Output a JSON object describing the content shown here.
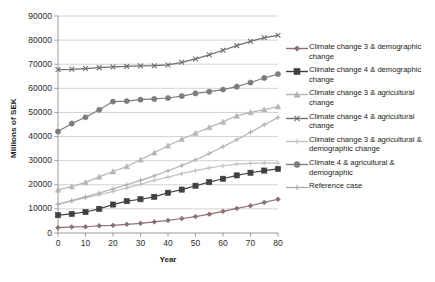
{
  "chart_data": {
    "type": "line",
    "title": "",
    "xlabel": "Year",
    "ylabel": "Millions of SEK",
    "xlim": [
      0,
      80
    ],
    "ylim": [
      0,
      90000
    ],
    "x": [
      0,
      5,
      10,
      15,
      20,
      25,
      30,
      35,
      40,
      45,
      50,
      55,
      60,
      65,
      70,
      75,
      80
    ],
    "xticks": [
      "0",
      "10",
      "20",
      "30",
      "40",
      "50",
      "60",
      "70",
      "80"
    ],
    "yticks": [
      "0",
      "10000",
      "20000",
      "30000",
      "40000",
      "50000",
      "60000",
      "70000",
      "80000",
      "90000"
    ],
    "grid": "horizontal",
    "legend_position": "right",
    "series": [
      {
        "name": "Climate change 3 & demographic change",
        "color": "#8c7070",
        "marker": "diamond",
        "values": [
          2200,
          2500,
          2600,
          3000,
          3200,
          3600,
          4000,
          4600,
          5200,
          6000,
          6800,
          7800,
          9000,
          10200,
          11300,
          12700,
          14000
        ]
      },
      {
        "name": "Climate change 4 & demographic change",
        "color": "#404040",
        "marker": "square",
        "values": [
          7400,
          7900,
          8700,
          10000,
          11800,
          13200,
          14000,
          15000,
          16700,
          18000,
          19600,
          21100,
          22500,
          23900,
          25000,
          25900,
          26600
        ]
      },
      {
        "name": "Climate change 3 & agricultural change",
        "color": "#b5b5b5",
        "marker": "triangle",
        "values": [
          17900,
          19300,
          21000,
          23300,
          25500,
          27600,
          30400,
          33300,
          36200,
          38900,
          41400,
          43800,
          46100,
          48600,
          50000,
          51200,
          52400
        ]
      },
      {
        "name": "Climate change 4 & agricultural change",
        "color": "#6e6e6e",
        "marker": "cross",
        "values": [
          67800,
          67900,
          68200,
          68600,
          68900,
          69100,
          69300,
          69400,
          69700,
          70800,
          72200,
          73900,
          75800,
          77700,
          79500,
          81000,
          82000
        ]
      },
      {
        "name": "Climate change 3 & agricultural & demographic change",
        "color": "#c2c2c2",
        "marker": "plus",
        "values": [
          12000,
          13300,
          14600,
          15900,
          17200,
          18700,
          20200,
          21800,
          23200,
          24600,
          25900,
          27000,
          27900,
          28600,
          28900,
          29000,
          29000
        ]
      },
      {
        "name": "Climate 4 & agricultural & demographic",
        "color": "#7d7d7d",
        "marker": "circle",
        "values": [
          42100,
          45400,
          48000,
          51100,
          54500,
          54700,
          55300,
          55600,
          56000,
          56800,
          57900,
          58600,
          59500,
          60700,
          62400,
          64300,
          65900
        ]
      },
      {
        "name": "Reference case",
        "color": "#b0b0b0",
        "marker": "plus",
        "values": [
          11900,
          13400,
          15000,
          16600,
          18300,
          20000,
          21800,
          23700,
          25800,
          28000,
          30300,
          33000,
          35800,
          38700,
          41800,
          44900,
          47900
        ]
      }
    ]
  },
  "axes": {
    "ylabel": "Millions of SEK",
    "xlabel": "Year"
  }
}
